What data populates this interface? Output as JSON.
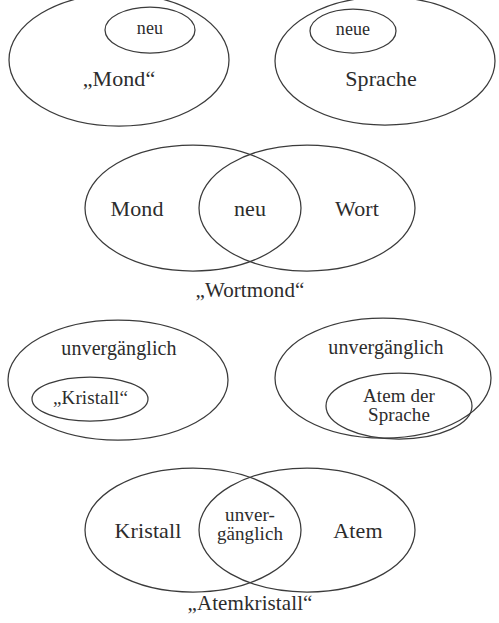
{
  "figure": {
    "kind": "set-diagram",
    "background_color": "#ffffff",
    "stroke_color": "#3b3b3b",
    "text_color": "#2c2c2c",
    "language": "de"
  },
  "groups": [
    {
      "id": "group-mond",
      "outer_label": "„Mond“",
      "inner_label": "neu"
    },
    {
      "id": "group-sprache",
      "outer_label": "Sprache",
      "inner_label": "neue"
    },
    {
      "id": "group-wortmond",
      "left_label": "Mond",
      "center_label": "neu",
      "right_label": "Wort",
      "caption": "„Wortmond“"
    },
    {
      "id": "group-kristall",
      "outer_label": "unvergänglich",
      "inner_label": "„Kristall“"
    },
    {
      "id": "group-atem-der-sprache",
      "outer_label": "unvergänglich",
      "inner_label_line1": "Atem der",
      "inner_label_line2": "Sprache"
    },
    {
      "id": "group-atemkristall",
      "left_label": "Kristall",
      "center_label_line1": "unver-",
      "center_label_line2": "gänglich",
      "right_label": "Atem",
      "caption": "„Atemkristall“"
    }
  ]
}
